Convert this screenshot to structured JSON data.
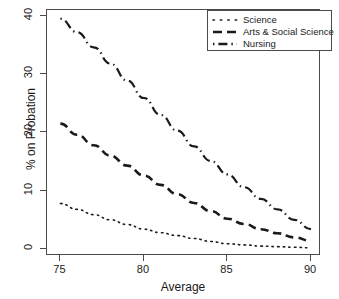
{
  "chart_data": {
    "type": "line",
    "title": "",
    "xlabel": "Average",
    "ylabel": "% on Probation",
    "xlim": [
      74.2,
      90.6
    ],
    "ylim": [
      -1.2,
      41.0
    ],
    "xticks": [
      75,
      80,
      85,
      90
    ],
    "yticks": [
      0,
      10,
      20,
      30,
      40
    ],
    "xtick_labels": [
      "75",
      "80",
      "85",
      "90"
    ],
    "ytick_labels": [
      "0",
      "10",
      "20",
      "30",
      "40"
    ],
    "grid": false,
    "legend_position": "top-right",
    "x": [
      75,
      76,
      77,
      78,
      79,
      80,
      81,
      82,
      83,
      84,
      85,
      86,
      87,
      88,
      89,
      90
    ],
    "series": [
      {
        "name": "Science",
        "linestyle": "dotted",
        "color": "#1a1a1a",
        "values": [
          7.8,
          6.8,
          5.9,
          5.0,
          4.2,
          3.4,
          2.8,
          2.3,
          1.8,
          1.3,
          0.9,
          0.7,
          0.5,
          0.4,
          0.3,
          0.2
        ]
      },
      {
        "name": "Arts & Social Science",
        "linestyle": "dashed",
        "color": "#1a1a1a",
        "values": [
          21.5,
          19.6,
          17.8,
          16.0,
          14.3,
          12.6,
          11.0,
          9.4,
          7.9,
          6.5,
          5.2,
          4.3,
          3.4,
          2.7,
          2.0,
          1.4
        ]
      },
      {
        "name": "Nursing",
        "linestyle": "dashdot",
        "color": "#1a1a1a",
        "values": [
          39.5,
          37.2,
          34.6,
          31.8,
          28.9,
          25.9,
          23.0,
          20.3,
          17.6,
          15.1,
          12.8,
          10.6,
          8.6,
          6.8,
          5.0,
          3.4
        ]
      }
    ]
  },
  "legend": {
    "entries": [
      {
        "label": "Science",
        "key": "dotted-line-key"
      },
      {
        "label": "Arts & Social Science",
        "key": "dashed-line-key"
      },
      {
        "label": "Nursing",
        "key": "dashdot-line-key"
      }
    ]
  },
  "axes": {
    "x_title": "Average",
    "y_title": "% on Probation"
  }
}
